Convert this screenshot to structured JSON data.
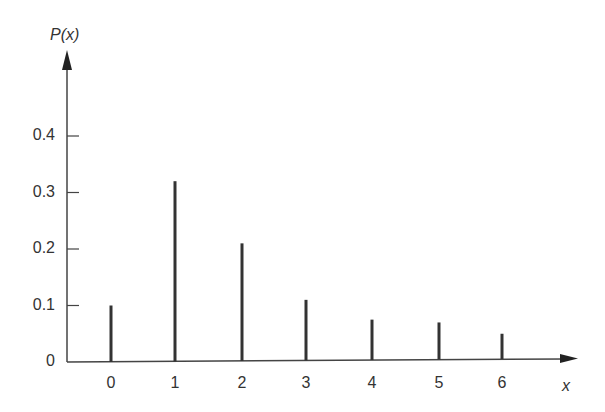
{
  "chart_data": {
    "type": "bar",
    "style": "stem",
    "title": "",
    "xlabel": "x",
    "ylabel": "P(x)",
    "categories": [
      "0",
      "1",
      "2",
      "3",
      "4",
      "5",
      "6"
    ],
    "values": [
      0.1,
      0.32,
      0.21,
      0.11,
      0.075,
      0.07,
      0.05
    ],
    "ylim": [
      0,
      0.5
    ],
    "yticks": [
      "0",
      "0.1",
      "0.2",
      "0.3",
      "0.4"
    ],
    "grid": false,
    "legend": null
  },
  "axes": {
    "y_title": "P(x)",
    "x_title": "x"
  },
  "colors": {
    "stem": "#333333",
    "axis": "#444444",
    "background": "#ffffff"
  }
}
